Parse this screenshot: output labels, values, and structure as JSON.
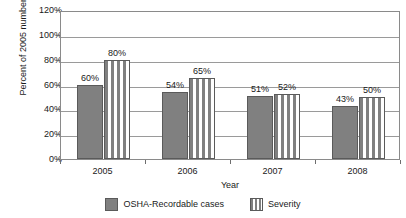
{
  "chart_data": {
    "type": "bar",
    "title": "",
    "xlabel": "Year",
    "ylabel": "Percent of 2005 numbers",
    "categories": [
      "2005",
      "2006",
      "2007",
      "2008"
    ],
    "series": [
      {
        "name": "OSHA-Recordable cases",
        "pattern": "solid",
        "color": "#808080",
        "values": [
          60,
          54,
          51,
          43
        ],
        "labels": [
          "60%",
          "54%",
          "51%",
          "43%"
        ]
      },
      {
        "name": "Severity",
        "pattern": "vertical-stripes",
        "color": "#808080",
        "values": [
          80,
          65,
          52,
          50
        ],
        "labels": [
          "80%",
          "65%",
          "52%",
          "50%"
        ]
      }
    ],
    "ylim": [
      0,
      120
    ],
    "ytick_values": [
      0,
      20,
      40,
      60,
      80,
      100,
      120
    ],
    "ytick_labels": [
      "0%",
      "20%",
      "40%",
      "60%",
      "80%",
      "100%",
      "120%"
    ],
    "grid": "horizontal",
    "legend_position": "bottom",
    "value_labels_shown": true
  },
  "legend": {
    "entries": [
      {
        "label": "OSHA-Recordable cases",
        "pattern": "solid"
      },
      {
        "label": "Severity",
        "pattern": "striped"
      }
    ]
  },
  "axis": {
    "x_title": "Year",
    "y_title": "Percent of 2005 numbers"
  }
}
